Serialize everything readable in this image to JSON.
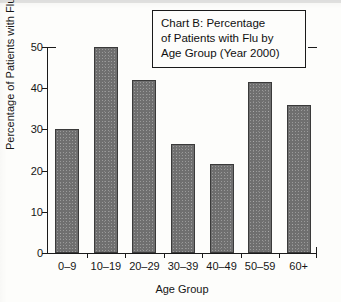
{
  "chart_data": {
    "type": "bar",
    "title": "Chart B: Percentage of Patients with Flu by Age Group (Year 2000)",
    "title_lines": [
      "Chart B: Percentage",
      "of Patients with Flu by",
      "Age Group (Year 2000)"
    ],
    "xlabel": "Age Group",
    "ylabel": "Percentage of Patients with Flu",
    "categories": [
      "0–9",
      "10–19",
      "20–29",
      "30–39",
      "40–49",
      "50–59",
      "60+"
    ],
    "values": [
      30,
      50,
      42,
      26.5,
      21.5,
      41.5,
      36
    ],
    "ylim": [
      0,
      50
    ],
    "yticks": [
      0,
      10,
      20,
      30,
      40,
      50
    ],
    "ytick_labels": [
      "0",
      "10",
      "20",
      "30",
      "40",
      "50"
    ],
    "grid": false,
    "legend": null,
    "bar_color": "#6f6f6f",
    "bar_edge_color": "#3a3a3a",
    "axis_color": "#1a1a1a",
    "background_color": "#fdfdfb"
  }
}
